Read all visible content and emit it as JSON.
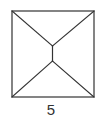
{
  "figure": {
    "label": "5",
    "stroke_color": "#333333",
    "background": "#ffffff",
    "square": {
      "x1": 12,
      "y1": 11,
      "x2": 94,
      "y2": 97
    },
    "inner_segment": {
      "x": 52.5,
      "y_top": 46,
      "y_bottom": 61
    }
  }
}
